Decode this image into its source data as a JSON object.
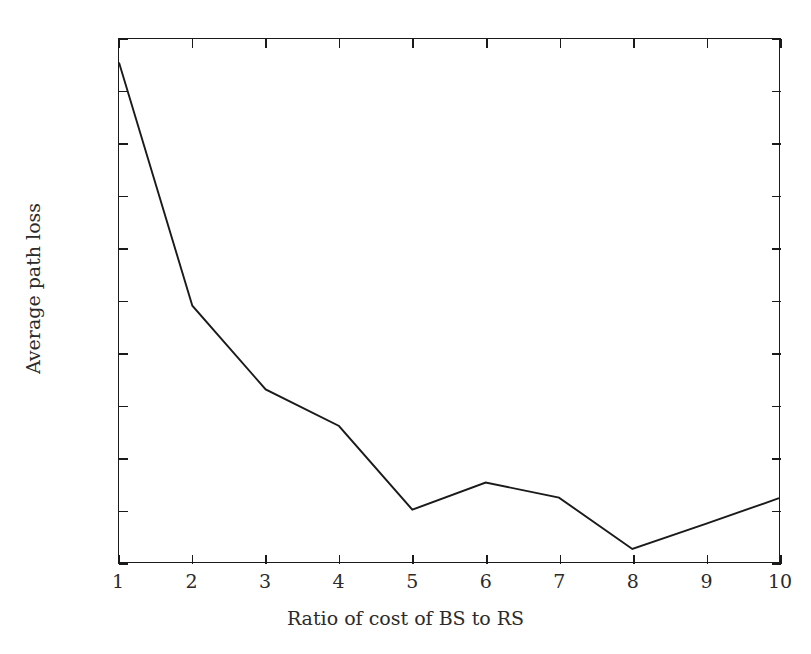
{
  "chart_data": {
    "type": "line",
    "title": "",
    "xlabel": "Ratio of cost of BS to RS",
    "ylabel": "Average path loss",
    "x": [
      1,
      2,
      3,
      4,
      5,
      6,
      7,
      8,
      9,
      10
    ],
    "values": [
      180.655,
      180.19,
      180.03,
      179.96,
      179.8,
      179.852,
      179.823,
      179.725,
      179.773,
      179.822
    ],
    "series": [
      {
        "name": "Average path loss",
        "values": [
          180.655,
          180.19,
          180.03,
          179.96,
          179.8,
          179.852,
          179.823,
          179.725,
          179.773,
          179.822
        ]
      }
    ],
    "xlim": [
      1,
      10
    ],
    "ylim": [
      179.7,
      180.7
    ],
    "xticks": [
      1,
      2,
      3,
      4,
      5,
      6,
      7,
      8,
      9,
      10
    ],
    "xtick_labels": [
      "1",
      "2",
      "3",
      "4",
      "5",
      "6",
      "7",
      "8",
      "9",
      "10"
    ],
    "yticks": [
      179.7,
      179.8,
      179.9,
      180.0,
      180.1,
      180.2,
      180.3,
      180.4,
      180.5,
      180.6,
      180.7
    ],
    "ytick_labels": [
      "179.7",
      "179.8",
      "179.9",
      "180",
      "180.1",
      "180.2",
      "180.3",
      "180.4",
      "180.5",
      "180.6",
      "180.7"
    ],
    "grid": false,
    "legend": null,
    "line_color": "#1a1a1a",
    "background_color": "#ffffff",
    "axis_color": "#1a1a1a",
    "markers": false
  }
}
